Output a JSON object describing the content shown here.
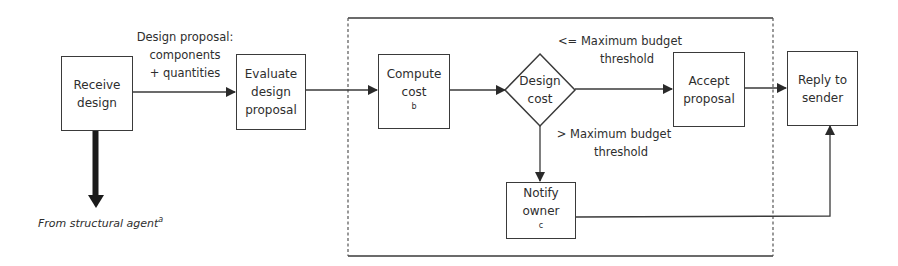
{
  "diagram": {
    "type": "flowchart",
    "colors": {
      "stroke": "#3a3a3a",
      "text": "#2e2e2e",
      "background": "#ffffff"
    },
    "nodes": {
      "receive_design": {
        "line1": "Receive",
        "line2": "design"
      },
      "evaluate_proposal": {
        "line1": "Evaluate",
        "line2": "design",
        "line3": "proposal"
      },
      "compute_cost": {
        "line1": "Compute",
        "line2": "cost",
        "footnote": "b"
      },
      "design_cost_decision": {
        "line1": "Design",
        "line2": "cost"
      },
      "accept_proposal": {
        "line1": "Accept",
        "line2": "proposal"
      },
      "reply_to_sender": {
        "line1": "Reply to",
        "line2": "sender"
      },
      "notify_owner": {
        "line1": "Notify",
        "line2": "owner",
        "footnote": "c"
      }
    },
    "edge_labels": {
      "design_proposal": {
        "line1": "Design proposal:",
        "line2": "components",
        "line3": "+ quantities"
      },
      "under_budget": {
        "line1": "<= Maximum budget",
        "line2": "threshold"
      },
      "over_budget": {
        "line1": "> Maximum budget",
        "line2": "threshold"
      }
    },
    "source_label": {
      "text": "From structural agent",
      "footnote": "a"
    },
    "edges": [
      {
        "from": "receive_design",
        "to": "evaluate_proposal",
        "label": "design_proposal"
      },
      {
        "from": "evaluate_proposal",
        "to": "compute_cost"
      },
      {
        "from": "compute_cost",
        "to": "design_cost_decision"
      },
      {
        "from": "design_cost_decision",
        "to": "accept_proposal",
        "label": "under_budget"
      },
      {
        "from": "design_cost_decision",
        "to": "notify_owner",
        "label": "over_budget"
      },
      {
        "from": "accept_proposal",
        "to": "reply_to_sender"
      },
      {
        "from": "notify_owner",
        "to": "reply_to_sender"
      },
      {
        "from": "structural_agent",
        "to": "receive_design",
        "style": "heavy"
      }
    ],
    "group": {
      "style": "dashed-left-right",
      "contains": [
        "compute_cost",
        "design_cost_decision",
        "accept_proposal",
        "notify_owner"
      ]
    }
  }
}
